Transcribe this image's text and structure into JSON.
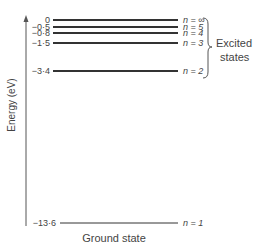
{
  "diagram": {
    "type": "energy-level-diagram",
    "axis_label": "Energy (eV)",
    "levels": [
      {
        "n": "∞",
        "energy": 0,
        "value_label": "0",
        "n_label": "n = ∞"
      },
      {
        "n": "5",
        "energy": -0.5,
        "value_label": "−0·5",
        "n_label": "n = 5"
      },
      {
        "n": "4",
        "energy": -0.8,
        "value_label": "−0·8",
        "n_label": "n = 4"
      },
      {
        "n": "3",
        "energy": -1.5,
        "value_label": "−1·5",
        "n_label": "n = 3"
      },
      {
        "n": "2",
        "energy": -3.4,
        "value_label": "−3·4",
        "n_label": "n = 2"
      },
      {
        "n": "1",
        "energy": -13.6,
        "value_label": "−13·6",
        "n_label": "n = 1"
      }
    ],
    "excited_label_line1": "Excited",
    "excited_label_line2": "states",
    "ground_label": "Ground state"
  }
}
